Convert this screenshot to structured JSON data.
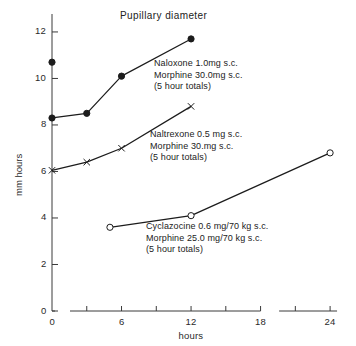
{
  "chart_data": {
    "type": "line",
    "title": "Pupillary diameter",
    "xlabel": "hours",
    "ylabel": "mm hours",
    "xlim": [
      0,
      25.2
    ],
    "ylim": [
      0,
      12.6
    ],
    "xticks": [
      0,
      6,
      12,
      18,
      24
    ],
    "xtick_labels": [
      "0",
      "6",
      "12",
      "18",
      "24"
    ],
    "yticks": [
      0,
      2,
      4,
      6,
      8,
      10,
      12
    ],
    "ytick_labels": [
      "0",
      "2",
      "4",
      "6",
      "8",
      "10",
      "12"
    ],
    "grid": false,
    "legend_position": "inline-annotations",
    "series": [
      {
        "name": "Naloxone 1.0mg s.c. / Morphine 30.0mg s.c.",
        "marker": "filled-circle",
        "x": [
          0,
          3,
          6,
          12
        ],
        "y": [
          8.3,
          8.5,
          10.1,
          11.7
        ]
      },
      {
        "name": "Naltrexone 0.5 mg s.c. / Morphine 30.mg s.c.",
        "marker": "cross",
        "x": [
          0,
          3,
          6,
          12
        ],
        "y": [
          6.05,
          6.4,
          7.0,
          8.8
        ]
      },
      {
        "name": "Cyclazocine 0.6 mg/70 kg s.c. / Morphine 25.0 mg/70 kg s.c.",
        "marker": "open-circle",
        "x": [
          5,
          12,
          24
        ],
        "y": [
          3.6,
          4.1,
          6.8
        ]
      }
    ],
    "extra_points": [
      {
        "name": "control-point",
        "marker": "filled-circle",
        "x": 0,
        "y": 10.7
      }
    ],
    "annotations": [
      {
        "id": "naloxone",
        "lines": [
          "Naloxone 1.0mg s.c.",
          "Morphine 30.0mg s.c.",
          "(5 hour totals)"
        ]
      },
      {
        "id": "naltrexone",
        "lines": [
          "Naltrexone 0.5 mg s.c.",
          "Morphine 30.mg s.c.",
          "(5 hour totals)"
        ]
      },
      {
        "id": "cyclazocine",
        "lines": [
          "Cyclazocine 0.6 mg/70 kg s.c.",
          "Morphine 25.0 mg/70 kg s.c.",
          "(5 hour totals)"
        ]
      }
    ],
    "colors": {
      "line": "#1c1c1c",
      "axis": "#3a3a3a",
      "text": "#222222",
      "background": "#ffffff"
    }
  }
}
